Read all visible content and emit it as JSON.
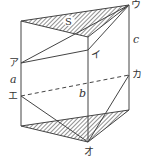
{
  "figure": {
    "type": "triangular-prism",
    "labels": {
      "area": "S",
      "a": "a",
      "b": "b",
      "c": "c",
      "point_a": "ア",
      "point_i": "イ",
      "point_u": "ウ",
      "point_e": "エ",
      "point_o": "オ",
      "point_ka": "カ"
    },
    "colors": {
      "stroke": "#444444",
      "hatch": "#555555",
      "background": "#ffffff"
    }
  }
}
